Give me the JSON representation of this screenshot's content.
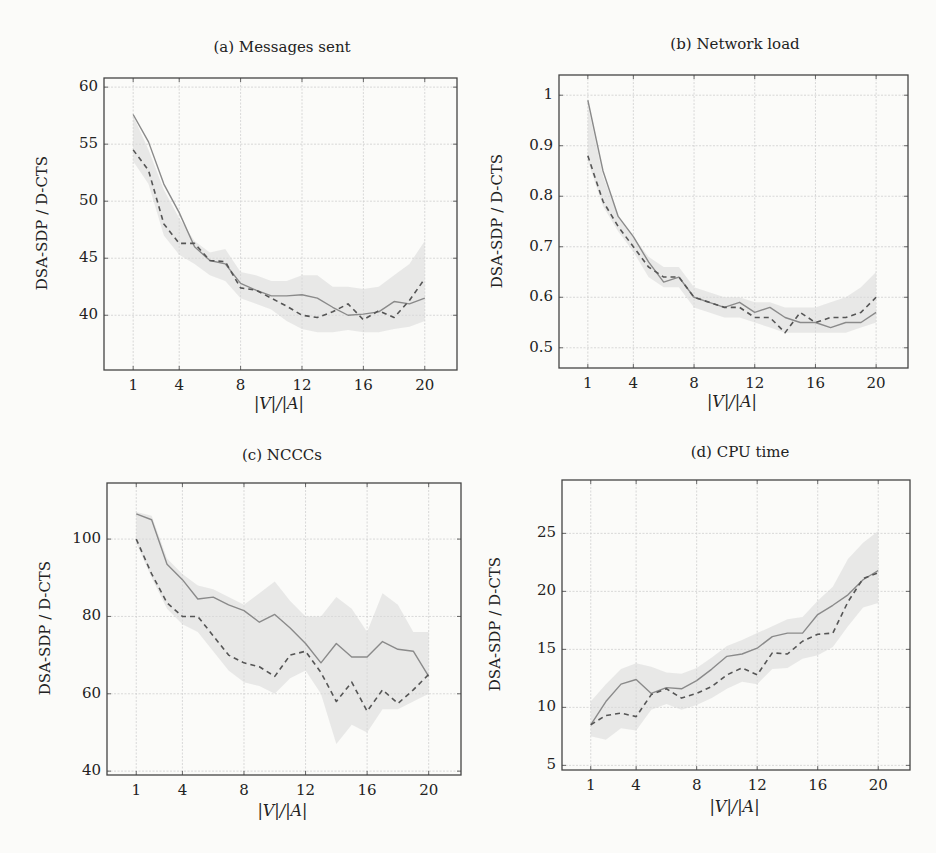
{
  "figure": {
    "shared_ylabel": "DSA-SDP / D-CTS",
    "shared_xlabel": "|V|/|A|",
    "x_ticks": [
      "1",
      "4",
      "8",
      "12",
      "16",
      "20"
    ]
  },
  "panels": [
    {
      "title": "(a) Messages sent",
      "y_ticks": [
        "60",
        "55",
        "50",
        "45",
        "40"
      ],
      "xlabel": "|V|/|A|",
      "ylabel": "DSA-SDP / D-CTS"
    },
    {
      "title": "(b) Network load",
      "y_ticks": [
        "1",
        "0.9",
        "0.8",
        "0.7",
        "0.6",
        "0.5"
      ],
      "xlabel": "|V|/|A|",
      "ylabel": "DSA-SDP / D-CTS"
    },
    {
      "title": "(c) NCCCs",
      "y_ticks": [
        "100",
        "80",
        "60",
        "40"
      ],
      "xlabel": "|V|/|A|",
      "ylabel": "DSA-SDP / D-CTS"
    },
    {
      "title": "(d) CPU time",
      "y_ticks": [
        "25",
        "20",
        "15",
        "10",
        "5"
      ],
      "xlabel": "|V|/|A|",
      "ylabel": "DSA-SDP / D-CTS"
    }
  ],
  "colors": {
    "solid_line": "#8a8a8a",
    "dashed_line": "#555555",
    "band": "#d9d9d9",
    "grid": "#cfcfcf",
    "axis": "#444444"
  },
  "chart_data": [
    {
      "type": "line",
      "title": "(a) Messages sent",
      "xlabel": "|V|/|A|",
      "ylabel": "DSA-SDP / D-CTS",
      "x": [
        1,
        2,
        3,
        4,
        5,
        6,
        7,
        8,
        9,
        10,
        11,
        12,
        13,
        14,
        15,
        16,
        17,
        18,
        19,
        20
      ],
      "xticks": [
        1,
        4,
        8,
        12,
        16,
        20
      ],
      "yticks": [
        40,
        45,
        50,
        55,
        60
      ],
      "ylim": [
        35.2,
        60.8
      ],
      "xlim": [
        -0.9,
        22.1
      ],
      "grid": true,
      "series": [
        {
          "name": "solid",
          "style": "solid",
          "values": [
            57.6,
            55.2,
            51.5,
            49.0,
            46.0,
            44.8,
            44.5,
            42.8,
            42.2,
            41.7,
            41.7,
            41.8,
            41.5,
            40.7,
            40.0,
            40.1,
            40.3,
            41.2,
            41.0,
            41.5
          ]
        },
        {
          "name": "dashed",
          "style": "dashed",
          "values": [
            54.5,
            52.7,
            48.0,
            46.3,
            46.3,
            44.8,
            44.7,
            42.4,
            42.2,
            41.5,
            40.8,
            40.0,
            39.8,
            40.3,
            41.0,
            39.6,
            40.4,
            39.8,
            41.3,
            43.2
          ]
        }
      ],
      "band": {
        "upper": [
          57.5,
          54.5,
          51.0,
          48.5,
          46.5,
          45.5,
          45.8,
          43.8,
          43.5,
          43.0,
          43.0,
          43.5,
          43.5,
          42.5,
          42.5,
          42.3,
          42.5,
          43.5,
          44.5,
          46.5
        ],
        "lower": [
          53.5,
          51.5,
          47.0,
          45.3,
          44.5,
          43.5,
          43.0,
          41.5,
          41.0,
          40.5,
          39.5,
          38.8,
          38.5,
          38.5,
          38.7,
          38.5,
          38.5,
          38.8,
          39.0,
          39.5
        ]
      }
    },
    {
      "type": "line",
      "title": "(b) Network load",
      "xlabel": "|V|/|A|",
      "ylabel": "DSA-SDP / D-CTS",
      "x": [
        1,
        2,
        3,
        4,
        5,
        6,
        7,
        8,
        9,
        10,
        11,
        12,
        13,
        14,
        15,
        16,
        17,
        18,
        19,
        20
      ],
      "xticks": [
        1,
        4,
        8,
        12,
        16,
        20
      ],
      "yticks": [
        0.5,
        0.6,
        0.7,
        0.8,
        0.9,
        1.0
      ],
      "ylim": [
        0.46,
        1.04
      ],
      "xlim": [
        -0.9,
        22.1
      ],
      "grid": true,
      "series": [
        {
          "name": "solid",
          "style": "solid",
          "values": [
            0.99,
            0.85,
            0.76,
            0.72,
            0.67,
            0.63,
            0.64,
            0.6,
            0.59,
            0.58,
            0.59,
            0.57,
            0.58,
            0.56,
            0.55,
            0.55,
            0.54,
            0.55,
            0.55,
            0.57
          ]
        },
        {
          "name": "dashed",
          "style": "dashed",
          "values": [
            0.88,
            0.79,
            0.74,
            0.7,
            0.66,
            0.64,
            0.64,
            0.6,
            0.59,
            0.58,
            0.58,
            0.56,
            0.56,
            0.53,
            0.57,
            0.55,
            0.56,
            0.56,
            0.57,
            0.6
          ]
        }
      ],
      "band": {
        "upper": [
          0.98,
          0.84,
          0.76,
          0.72,
          0.68,
          0.66,
          0.66,
          0.62,
          0.61,
          0.6,
          0.6,
          0.59,
          0.59,
          0.58,
          0.58,
          0.58,
          0.59,
          0.6,
          0.62,
          0.65
        ],
        "lower": [
          0.87,
          0.78,
          0.73,
          0.69,
          0.64,
          0.62,
          0.62,
          0.58,
          0.57,
          0.56,
          0.56,
          0.55,
          0.54,
          0.53,
          0.53,
          0.53,
          0.53,
          0.53,
          0.54,
          0.55
        ]
      }
    },
    {
      "type": "line",
      "title": "(c) NCCCs",
      "xlabel": "|V|/|A|",
      "ylabel": "DSA-SDP / D-CTS",
      "x": [
        1,
        2,
        3,
        4,
        5,
        6,
        7,
        8,
        9,
        10,
        11,
        12,
        13,
        14,
        15,
        16,
        17,
        18,
        19,
        20
      ],
      "xticks": [
        1,
        4,
        8,
        12,
        16,
        20
      ],
      "yticks": [
        40,
        60,
        80,
        100
      ],
      "ylim": [
        39,
        114.5
      ],
      "xlim": [
        -0.9,
        22.1
      ],
      "grid": true,
      "series": [
        {
          "name": "solid",
          "style": "solid",
          "values": [
            106.5,
            105,
            93.5,
            89.5,
            84.5,
            85,
            83,
            81.5,
            78.5,
            80.5,
            77,
            73,
            68,
            73,
            69.5,
            69.5,
            73.5,
            71.5,
            71,
            64.5
          ]
        },
        {
          "name": "dashed",
          "style": "dashed",
          "values": [
            100,
            91,
            83.5,
            80,
            80,
            75,
            70,
            68,
            67,
            64.5,
            70,
            71,
            65.5,
            58,
            63,
            55.5,
            61,
            57.5,
            61,
            65
          ]
        }
      ],
      "band": {
        "upper": [
          107,
          106,
          95,
          91,
          88,
          87,
          85,
          83,
          86,
          89,
          84,
          80,
          80,
          85,
          82,
          76,
          86,
          83,
          76,
          76
        ],
        "lower": [
          99,
          90,
          82,
          78,
          76,
          71,
          66,
          63,
          62,
          60,
          64,
          66,
          60,
          47,
          52,
          50,
          56,
          56,
          58,
          60
        ]
      }
    },
    {
      "type": "line",
      "title": "(d) CPU time",
      "xlabel": "|V|/|A|",
      "ylabel": "DSA-SDP / D-CTS",
      "x": [
        1,
        2,
        3,
        4,
        5,
        6,
        7,
        8,
        9,
        10,
        11,
        12,
        13,
        14,
        15,
        16,
        17,
        18,
        19,
        20
      ],
      "xticks": [
        1,
        4,
        8,
        12,
        16,
        20
      ],
      "yticks": [
        5,
        10,
        15,
        20,
        25
      ],
      "ylim": [
        4.6,
        29.6
      ],
      "xlim": [
        -0.9,
        22.1
      ],
      "grid": true,
      "series": [
        {
          "name": "solid",
          "style": "solid",
          "values": [
            8.5,
            10.5,
            12.0,
            12.4,
            11.2,
            11.7,
            11.6,
            12.3,
            13.3,
            14.4,
            14.6,
            15.1,
            16.1,
            16.4,
            16.4,
            18.0,
            18.8,
            19.7,
            21.0,
            21.8
          ]
        },
        {
          "name": "dashed",
          "style": "dashed",
          "values": [
            8.5,
            9.3,
            9.5,
            9.2,
            11.1,
            11.6,
            10.8,
            11.2,
            11.8,
            12.8,
            13.4,
            12.8,
            14.7,
            14.6,
            15.7,
            16.3,
            16.4,
            19.1,
            21.1,
            21.6
          ]
        }
      ],
      "band": {
        "upper": [
          10.5,
          12.0,
          13.3,
          13.8,
          13.5,
          13.0,
          12.9,
          13.4,
          14.3,
          15.3,
          15.8,
          16.4,
          17.0,
          17.6,
          17.8,
          19.2,
          20.4,
          22.8,
          24.2,
          25.2
        ],
        "lower": [
          7.5,
          7.2,
          8.2,
          8.0,
          9.8,
          10.3,
          9.8,
          10.2,
          10.8,
          11.6,
          12.2,
          12.0,
          13.3,
          13.4,
          14.2,
          14.5,
          15.2,
          17.0,
          18.6,
          19.0
        ]
      }
    }
  ]
}
